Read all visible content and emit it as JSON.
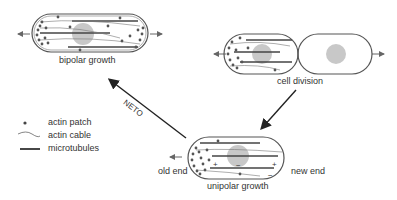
{
  "labels": {
    "bipolar": "bipolar growth",
    "division": "cell division",
    "unipolar": "unipolar growth",
    "old_end": "old end",
    "new_end": "new end",
    "neto": "NETO"
  },
  "legend": {
    "items": [
      {
        "symbol": "dot",
        "label": "actin patch"
      },
      {
        "symbol": "wavy-line",
        "label": "actin cable"
      },
      {
        "symbol": "thick-line",
        "label": "microtubules"
      }
    ]
  },
  "colors": {
    "outline": "#555555",
    "nucleus": "#c8c8c8",
    "ink": "#333333"
  }
}
